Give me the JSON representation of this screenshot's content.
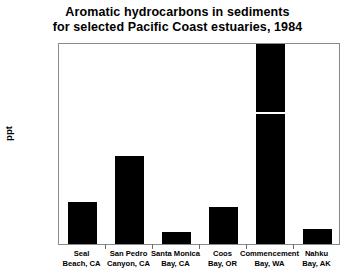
{
  "chart_data": {
    "type": "bar",
    "title": "Aromatic hydrocarbons in sediments for selected Pacific Coast estuaries, 1984",
    "title_lines": [
      "Aromatic hydrocarbons in sediments",
      "for selected Pacific Coast estuaries, 1984"
    ],
    "xlabel": "",
    "ylabel": "ppt",
    "ylim": [
      0.0,
      1.2
    ],
    "ytick_labels": [
      "0.0",
      "0.1",
      "0.2",
      "0.3",
      "0.4",
      "0.5",
      "0.6",
      "0.7",
      "0.8",
      "0.9",
      "1.0",
      "1.1",
      "1.2"
    ],
    "ytick_values": [
      0.0,
      0.1,
      0.2,
      0.3,
      0.4,
      0.5,
      0.6,
      0.7,
      0.8,
      0.9,
      1.0,
      1.1,
      1.2
    ],
    "grid": false,
    "legend": false,
    "bar_color": "#000000",
    "categories": [
      "Seal Beach, CA",
      "San Pedro Canyon, CA",
      "Santa Monica Bay, CA",
      "Coos Bay, OR",
      "Commencement Bay, WA",
      "Nahku Bay, AK"
    ],
    "category_lines": [
      [
        "Seal",
        "Beach, CA"
      ],
      [
        "San Pedro",
        "Canyon, CA"
      ],
      [
        "Santa Monica",
        "Bay, CA"
      ],
      [
        "Coos",
        "Bay, OR"
      ],
      [
        "Commencement",
        "Bay, WA"
      ],
      [
        "Nahku",
        "Bay, AK"
      ]
    ],
    "values": [
      0.25,
      0.52,
      0.07,
      0.22,
      1.2,
      0.09
    ],
    "bars": [
      {
        "category": "Seal Beach, CA",
        "value": 0.25,
        "clipped": false
      },
      {
        "category": "San Pedro Canyon, CA",
        "value": 0.52,
        "clipped": false
      },
      {
        "category": "Santa Monica Bay, CA",
        "value": 0.07,
        "clipped": false
      },
      {
        "category": "Coos Bay, OR",
        "value": 0.22,
        "clipped": false
      },
      {
        "category": "Commencement Bay, WA",
        "value": 1.2,
        "clipped": true,
        "break_at": 0.77
      },
      {
        "category": "Nahku Bay, AK",
        "value": 0.09,
        "clipped": false
      }
    ]
  }
}
